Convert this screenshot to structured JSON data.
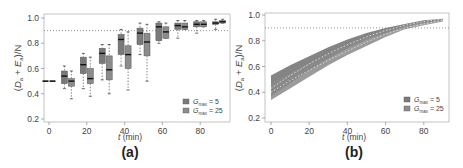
{
  "chart_data": [
    {
      "panel": "(a)",
      "type": "box",
      "xlabel": "t (min)",
      "ylabel": "(D_a + E_a)/N",
      "ylim": [
        0.2,
        1.0
      ],
      "yticks": [
        "0.2",
        "0.4",
        "0.6",
        "0.8",
        "1.0"
      ],
      "xticks": [
        "0",
        "20",
        "40",
        "60",
        "80"
      ],
      "reference_line": 0.9,
      "legend": [
        "G_max = 5",
        "G_max = 25"
      ],
      "legend_position": "lower right",
      "series": [
        {
          "name": "G_max = 5",
          "boxes": [
            {
              "t": 0,
              "min": 0.5,
              "q1": 0.5,
              "median": 0.5,
              "q3": 0.5,
              "max": 0.5
            },
            {
              "t": 10,
              "min": 0.44,
              "q1": 0.48,
              "median": 0.54,
              "q3": 0.58,
              "max": 0.62
            },
            {
              "t": 20,
              "min": 0.44,
              "q1": 0.56,
              "median": 0.63,
              "q3": 0.69,
              "max": 0.72
            },
            {
              "t": 30,
              "min": 0.51,
              "q1": 0.64,
              "median": 0.72,
              "q3": 0.76,
              "max": 0.79
            },
            {
              "t": 40,
              "min": 0.62,
              "q1": 0.71,
              "median": 0.83,
              "q3": 0.87,
              "max": 0.91
            },
            {
              "t": 50,
              "min": 0.71,
              "q1": 0.79,
              "median": 0.88,
              "q3": 0.92,
              "max": 0.96
            },
            {
              "t": 60,
              "min": 0.8,
              "q1": 0.82,
              "median": 0.93,
              "q3": 0.96,
              "max": 0.97
            },
            {
              "t": 70,
              "min": 0.84,
              "q1": 0.91,
              "median": 0.94,
              "q3": 0.96,
              "max": 0.98
            },
            {
              "t": 80,
              "min": 0.88,
              "q1": 0.93,
              "median": 0.95,
              "q3": 0.97,
              "max": 0.98
            },
            {
              "t": 90,
              "min": 0.91,
              "q1": 0.95,
              "median": 0.96,
              "q3": 0.97,
              "max": 0.99
            }
          ]
        },
        {
          "name": "G_max = 25",
          "boxes": [
            {
              "t": 0,
              "min": 0.5,
              "q1": 0.5,
              "median": 0.5,
              "q3": 0.5,
              "max": 0.5
            },
            {
              "t": 10,
              "min": 0.36,
              "q1": 0.46,
              "median": 0.5,
              "q3": 0.52,
              "max": 0.58
            },
            {
              "t": 20,
              "min": 0.38,
              "q1": 0.48,
              "median": 0.52,
              "q3": 0.6,
              "max": 0.69
            },
            {
              "t": 30,
              "min": 0.4,
              "q1": 0.51,
              "median": 0.59,
              "q3": 0.7,
              "max": 0.79
            },
            {
              "t": 40,
              "min": 0.43,
              "q1": 0.6,
              "median": 0.71,
              "q3": 0.78,
              "max": 0.89
            },
            {
              "t": 50,
              "min": 0.5,
              "q1": 0.7,
              "median": 0.81,
              "q3": 0.88,
              "max": 0.95
            },
            {
              "t": 60,
              "min": 0.84,
              "q1": 0.84,
              "median": 0.89,
              "q3": 0.93,
              "max": 0.96
            },
            {
              "t": 70,
              "min": 0.91,
              "q1": 0.91,
              "median": 0.93,
              "q3": 0.96,
              "max": 0.98
            },
            {
              "t": 80,
              "min": 0.93,
              "q1": 0.93,
              "median": 0.95,
              "q3": 0.97,
              "max": 0.98
            },
            {
              "t": 90,
              "min": 0.96,
              "q1": 0.96,
              "median": 0.97,
              "q3": 0.98,
              "max": 0.99
            }
          ]
        }
      ]
    },
    {
      "panel": "(b)",
      "type": "area",
      "xlabel": "t (min)",
      "ylabel": "(D_a + E_a)/N",
      "ylim": [
        0.2,
        1.0
      ],
      "yticks": [
        "0.2",
        "0.4",
        "0.6",
        "0.8",
        "1.0"
      ],
      "xticks": [
        "0",
        "20",
        "40",
        "60",
        "80"
      ],
      "reference_line": 0.9,
      "legend": [
        "G_max = 5",
        "G_max = 25"
      ],
      "legend_position": "lower right",
      "x": [
        0,
        10,
        20,
        30,
        40,
        50,
        60,
        70,
        80,
        90
      ],
      "series": [
        {
          "name": "G_max = 5",
          "mean": [
            0.43,
            0.53,
            0.62,
            0.7,
            0.77,
            0.83,
            0.88,
            0.92,
            0.95,
            0.97
          ],
          "lower": [
            0.37,
            0.47,
            0.57,
            0.66,
            0.74,
            0.81,
            0.86,
            0.91,
            0.94,
            0.96
          ],
          "upper": [
            0.53,
            0.61,
            0.68,
            0.75,
            0.81,
            0.86,
            0.9,
            0.93,
            0.96,
            0.97
          ]
        },
        {
          "name": "G_max = 25",
          "mean": [
            0.4,
            0.49,
            0.57,
            0.65,
            0.72,
            0.79,
            0.85,
            0.9,
            0.93,
            0.96
          ],
          "lower": [
            0.34,
            0.43,
            0.52,
            0.61,
            0.69,
            0.76,
            0.83,
            0.89,
            0.92,
            0.95
          ],
          "upper": [
            0.47,
            0.55,
            0.63,
            0.7,
            0.77,
            0.83,
            0.88,
            0.92,
            0.95,
            0.97
          ]
        }
      ]
    }
  ],
  "panels": {
    "a": {
      "label": "(a)",
      "xlabel_t": "t",
      "xlabel_unit": " (min)",
      "legend1_sub": "max",
      "legend1_val": " = 5",
      "legend2_sub": "max",
      "legend2_val": " = 25",
      "legend_g": "G"
    },
    "b": {
      "label": "(b)",
      "xlabel_t": "t",
      "xlabel_unit": " (min)",
      "legend1_sub": "max",
      "legend1_val": " = 5",
      "legend2_sub": "max",
      "legend2_val": " = 25",
      "legend_g": "G"
    }
  },
  "colors": {
    "series1": "#7a7a7a",
    "series2": "#8c8c8c",
    "median": "#111111",
    "axis": "#888888",
    "ref_line": "#777777"
  }
}
